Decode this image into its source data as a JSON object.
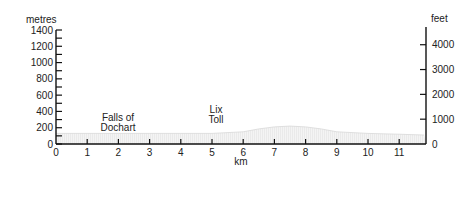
{
  "chart_data": {
    "type": "area",
    "title": "",
    "xlabel": "km",
    "ylabel_left": "metres",
    "ylabel_right": "feet",
    "x_ticks": [
      0,
      1,
      2,
      3,
      4,
      5,
      6,
      7,
      8,
      9,
      10,
      11
    ],
    "y_left_ticks": [
      0,
      200,
      400,
      600,
      800,
      1000,
      1200,
      1400
    ],
    "y_right_ticks": [
      0,
      1000,
      2000,
      3000,
      4000
    ],
    "xlim": [
      0,
      11.8
    ],
    "ylim_left": [
      0,
      1400
    ],
    "grid": false,
    "series": [
      {
        "name": "elevation profile",
        "x": [
          0,
          1,
          2,
          3,
          4,
          5,
          6,
          6.5,
          7,
          7.5,
          8,
          8.5,
          9,
          10,
          11,
          11.8
        ],
        "values": [
          130,
          130,
          130,
          130,
          130,
          130,
          150,
          185,
          210,
          220,
          210,
          185,
          150,
          130,
          120,
          110
        ]
      }
    ],
    "annotations": [
      {
        "text": "Falls of\nDochart",
        "x": 1.9,
        "y": 160
      },
      {
        "text": "Lix\nToll",
        "x": 5.2,
        "y": 220
      }
    ]
  },
  "labels": {
    "left_unit": "metres",
    "right_unit": "feet",
    "x_unit": "km",
    "falls_line1": "Falls of",
    "falls_line2": "Dochart",
    "lix_line1": "Lix",
    "lix_line2": "Toll"
  }
}
